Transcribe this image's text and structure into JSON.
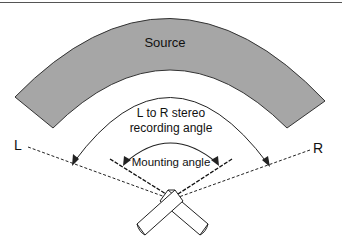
{
  "diagram": {
    "source_label": "Source",
    "recording_angle_label_line1": "L to R stereo",
    "recording_angle_label_line2": "recording angle",
    "mounting_angle_label": "Mounting angle",
    "left_label": "L",
    "right_label": "R"
  },
  "colors": {
    "source_fill": "#a6a6a6",
    "stroke": "#222222",
    "background": "#ffffff"
  }
}
